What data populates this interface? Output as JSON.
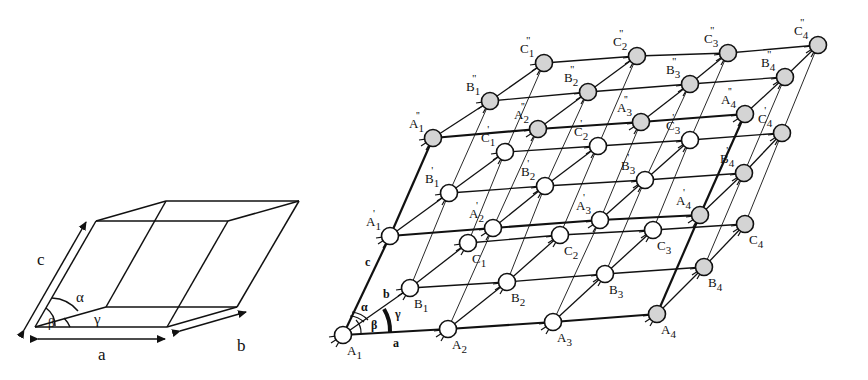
{
  "cell": {
    "labels": {
      "a": "a",
      "b": "b",
      "c": "c",
      "alpha": "α",
      "beta": "β",
      "gamma": "γ"
    },
    "corners": {
      "o": [
        35,
        327
      ],
      "a": [
        167,
        327
      ],
      "b": [
        106,
        307
      ],
      "ab": [
        237,
        307
      ],
      "c": [
        96,
        221
      ],
      "ac": [
        228,
        221
      ],
      "bc": [
        166,
        201
      ],
      "abc": [
        299,
        201
      ]
    }
  },
  "lattice": {
    "colors": {
      "open": "#ffffff",
      "shaded": "#d4d4d4",
      "stroke": "#111111"
    },
    "axis_labels": {
      "a": "a",
      "b": "b",
      "c": "c",
      "alpha": "α",
      "beta": "β",
      "gamma": "γ"
    },
    "layers": [
      {
        "name": "base",
        "rows": [
          {
            "row": "A",
            "nodes": [
              {
                "label": "A",
                "sub": "1",
                "prime": "",
                "x": 343,
                "y": 335,
                "shaded": false
              },
              {
                "label": "A",
                "sub": "2",
                "prime": "",
                "x": 448,
                "y": 329,
                "shaded": false
              },
              {
                "label": "A",
                "sub": "3",
                "prime": "",
                "x": 553,
                "y": 322,
                "shaded": false
              },
              {
                "label": "A",
                "sub": "4",
                "prime": "",
                "x": 657,
                "y": 314,
                "shaded": true
              }
            ]
          },
          {
            "row": "B",
            "nodes": [
              {
                "label": "B",
                "sub": "1",
                "prime": "",
                "x": 410,
                "y": 288,
                "shaded": false
              },
              {
                "label": "B",
                "sub": "2",
                "prime": "",
                "x": 507,
                "y": 282,
                "shaded": false
              },
              {
                "label": "B",
                "sub": "3",
                "prime": "",
                "x": 605,
                "y": 274,
                "shaded": false
              },
              {
                "label": "B",
                "sub": "4",
                "prime": "",
                "x": 704,
                "y": 267,
                "shaded": true
              }
            ]
          },
          {
            "row": "C",
            "nodes": [
              {
                "label": "C",
                "sub": "1",
                "prime": "",
                "x": 468,
                "y": 243,
                "shaded": false
              },
              {
                "label": "C",
                "sub": "2",
                "prime": "",
                "x": 560,
                "y": 235,
                "shaded": false
              },
              {
                "label": "C",
                "sub": "3",
                "prime": "",
                "x": 653,
                "y": 230,
                "shaded": false
              },
              {
                "label": "C",
                "sub": "4",
                "prime": "",
                "x": 745,
                "y": 224,
                "shaded": true
              }
            ]
          }
        ]
      },
      {
        "name": "middle",
        "rows": [
          {
            "row": "A'",
            "nodes": [
              {
                "label": "A",
                "sub": "1",
                "prime": "'",
                "x": 390,
                "y": 236,
                "shaded": false
              },
              {
                "label": "A",
                "sub": "2",
                "prime": "'",
                "x": 493,
                "y": 228,
                "shaded": false
              },
              {
                "label": "A",
                "sub": "3",
                "prime": "'",
                "x": 600,
                "y": 220,
                "shaded": false
              },
              {
                "label": "A",
                "sub": "4",
                "prime": "'",
                "x": 700,
                "y": 215,
                "shaded": true
              }
            ]
          },
          {
            "row": "B'",
            "nodes": [
              {
                "label": "B",
                "sub": "1",
                "prime": "'",
                "x": 449,
                "y": 193,
                "shaded": false
              },
              {
                "label": "B",
                "sub": "2",
                "prime": "'",
                "x": 545,
                "y": 186,
                "shaded": false
              },
              {
                "label": "B",
                "sub": "3",
                "prime": "'",
                "x": 645,
                "y": 180,
                "shaded": false
              },
              {
                "label": "B",
                "sub": "4",
                "prime": "'",
                "x": 744,
                "y": 173,
                "shaded": true
              }
            ]
          },
          {
            "row": "C'",
            "nodes": [
              {
                "label": "C",
                "sub": "1",
                "prime": "'",
                "x": 505,
                "y": 152,
                "shaded": false
              },
              {
                "label": "C",
                "sub": "2",
                "prime": "'",
                "x": 598,
                "y": 146,
                "shaded": false
              },
              {
                "label": "C",
                "sub": "3",
                "prime": "'",
                "x": 690,
                "y": 140,
                "shaded": false
              },
              {
                "label": "C",
                "sub": "4",
                "prime": "'",
                "x": 782,
                "y": 133,
                "shaded": true
              }
            ]
          }
        ]
      },
      {
        "name": "top",
        "rows": [
          {
            "row": "A''",
            "nodes": [
              {
                "label": "A",
                "sub": "1",
                "prime": "''",
                "x": 433,
                "y": 138,
                "shaded": true
              },
              {
                "label": "A",
                "sub": "2",
                "prime": "''",
                "x": 538,
                "y": 129,
                "shaded": true
              },
              {
                "label": "A",
                "sub": "3",
                "prime": "''",
                "x": 641,
                "y": 122,
                "shaded": true
              },
              {
                "label": "A",
                "sub": "4",
                "prime": "''",
                "x": 745,
                "y": 114,
                "shaded": true
              }
            ]
          },
          {
            "row": "B''",
            "nodes": [
              {
                "label": "B",
                "sub": "1",
                "prime": "''",
                "x": 490,
                "y": 101,
                "shaded": true
              },
              {
                "label": "B",
                "sub": "2",
                "prime": "''",
                "x": 588,
                "y": 92,
                "shaded": true
              },
              {
                "label": "B",
                "sub": "3",
                "prime": "''",
                "x": 690,
                "y": 84,
                "shaded": true
              },
              {
                "label": "B",
                "sub": "4",
                "prime": "''",
                "x": 785,
                "y": 77,
                "shaded": true
              }
            ]
          },
          {
            "row": "C''",
            "nodes": [
              {
                "label": "C",
                "sub": "1",
                "prime": "''",
                "x": 544,
                "y": 63,
                "shaded": true
              },
              {
                "label": "C",
                "sub": "2",
                "prime": "''",
                "x": 637,
                "y": 56,
                "shaded": true
              },
              {
                "label": "C",
                "sub": "3",
                "prime": "''",
                "x": 728,
                "y": 53,
                "shaded": true
              },
              {
                "label": "C",
                "sub": "4",
                "prime": "''",
                "x": 818,
                "y": 45,
                "shaded": true
              }
            ]
          }
        ]
      }
    ]
  }
}
